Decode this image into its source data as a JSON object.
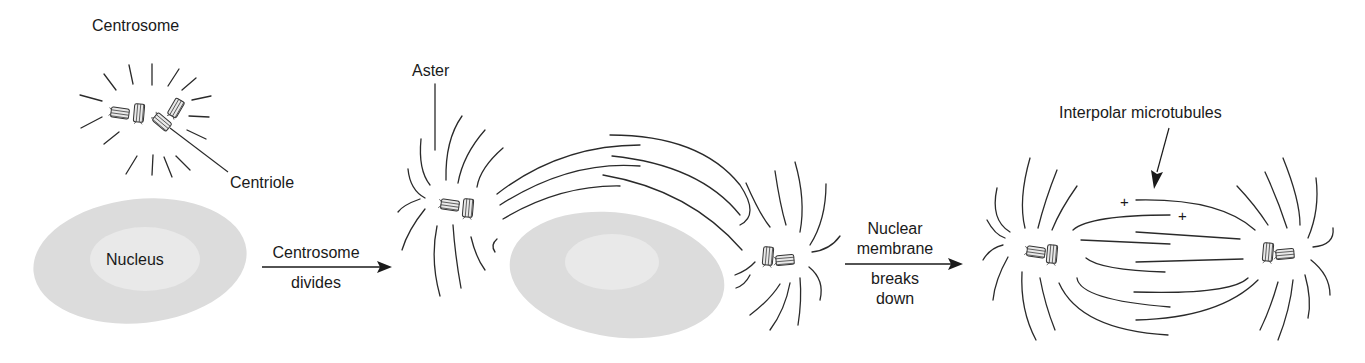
{
  "diagram": {
    "stages": [
      {
        "id": "stage-1",
        "labels": {
          "centrosome": "Centrosome",
          "centriole": "Centriole",
          "nucleus": "Nucleus"
        }
      },
      {
        "id": "stage-2",
        "labels": {
          "aster": "Aster"
        }
      },
      {
        "id": "stage-3",
        "labels": {
          "interpolar": "Interpolar microtubules",
          "plus_1": "+",
          "plus_2": "+"
        }
      }
    ],
    "transitions": [
      {
        "line1": "Centrosome",
        "line2": "divides"
      },
      {
        "line1": "Nuclear",
        "line2": "membrane",
        "line3": "breaks",
        "line4": "down"
      }
    ],
    "colors": {
      "nucleus_outer": "#dcdcdc",
      "nucleus_inner": "#e9e9e9",
      "line": "#2a2a2a",
      "background": "#ffffff"
    }
  }
}
